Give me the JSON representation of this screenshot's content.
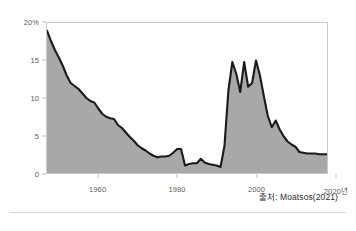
{
  "figure": {
    "source_note": "출처: Moatsos(2021)",
    "colors": {
      "area_fill": "#a8a8a8",
      "line": "#1a1a1a",
      "frame": "#c9c9c9",
      "tick_text": "#5a5a5a",
      "rule": "#d7d7d7"
    }
  },
  "chart_data": {
    "type": "area",
    "title": "",
    "subtitle": "",
    "xlabel": "",
    "ylabel": "",
    "unit": "%",
    "grid": false,
    "legend": null,
    "xlim": [
      1947,
      2018
    ],
    "ylim": [
      0,
      20
    ],
    "ytick_labels": [
      "20%",
      "15",
      "10",
      "5",
      "0"
    ],
    "ytick_values": [
      20,
      15,
      10,
      5,
      0
    ],
    "xtick_labels": [
      "1960",
      "1980",
      "2000",
      "2020년"
    ],
    "xtick_values": [
      1960,
      1980,
      2000,
      2020
    ],
    "series": [
      {
        "name": "extreme poverty rate",
        "x": [
          1947,
          1948,
          1949,
          1950,
          1951,
          1952,
          1953,
          1954,
          1955,
          1956,
          1957,
          1958,
          1959,
          1960,
          1961,
          1962,
          1963,
          1964,
          1965,
          1966,
          1967,
          1968,
          1969,
          1970,
          1971,
          1972,
          1973,
          1974,
          1975,
          1976,
          1977,
          1978,
          1979,
          1980,
          1981,
          1982,
          1983,
          1984,
          1985,
          1986,
          1987,
          1988,
          1989,
          1990,
          1991,
          1992,
          1993,
          1994,
          1995,
          1996,
          1997,
          1998,
          1999,
          2000,
          2001,
          2002,
          2003,
          2004,
          2005,
          2006,
          2007,
          2008,
          2009,
          2010,
          2011,
          2012,
          2013,
          2014,
          2015,
          2016,
          2017,
          2018
        ],
        "values": [
          19.0,
          17.6,
          16.4,
          15.4,
          14.3,
          13.0,
          12.0,
          11.6,
          11.2,
          10.6,
          10.0,
          9.6,
          9.4,
          8.6,
          7.9,
          7.5,
          7.3,
          7.2,
          6.4,
          6.0,
          5.4,
          4.8,
          4.3,
          3.7,
          3.3,
          3.0,
          2.6,
          2.3,
          2.1,
          2.2,
          2.2,
          2.3,
          2.7,
          3.2,
          3.2,
          1.0,
          1.2,
          1.3,
          1.3,
          1.9,
          1.4,
          1.2,
          1.1,
          1.0,
          0.8,
          3.6,
          11.0,
          14.8,
          13.2,
          10.8,
          14.8,
          11.5,
          12.0,
          15.0,
          13.0,
          10.2,
          7.6,
          6.1,
          7.0,
          5.8,
          4.9,
          4.2,
          3.8,
          3.5,
          2.8,
          2.7,
          2.6,
          2.6,
          2.6,
          2.5,
          2.5,
          2.5
        ]
      }
    ]
  }
}
